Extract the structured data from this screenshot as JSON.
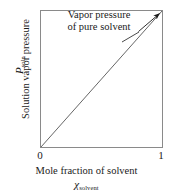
{
  "chart_data": {
    "type": "line",
    "title": "",
    "xlabel": "Mole fraction of solvent",
    "xlabel_symbol_main": "χ",
    "xlabel_symbol_sub": "solvent",
    "ylabel": "Solution vapor pressure",
    "ylabel_symbol_main": "P",
    "ylabel_symbol_sub": "soln",
    "xlim": [
      0,
      1
    ],
    "ylim": [
      0,
      1
    ],
    "xticks": [
      "0",
      "1"
    ],
    "xtick_values": [
      0,
      1
    ],
    "yticks": [],
    "grid": false,
    "legend": false,
    "series": [
      {
        "name": "Raoult's law line",
        "x": [
          0,
          1
        ],
        "values": [
          0,
          1
        ],
        "color": "#555555"
      }
    ],
    "annotations": [
      {
        "text_lines": [
          "Vapor pressure",
          "of pure solvent"
        ],
        "points_to_x": 1,
        "points_to_y": 1,
        "arrow": true
      }
    ],
    "frame_color": "#8a8a8a",
    "background": "#ffffff",
    "line_color": "#555555",
    "text_color": "#1a1a1a"
  },
  "annotation": {
    "line1": "Vapor pressure",
    "line2": "of pure solvent"
  },
  "axes": {
    "y_title": "Solution vapor pressure",
    "y_symbol_main": "P",
    "y_symbol_sub": "soln",
    "x_title": "Mole fraction of solvent",
    "x_symbol_main": "χ",
    "x_symbol_sub": "solvent",
    "x_tick_min": "0",
    "x_tick_max": "1"
  }
}
